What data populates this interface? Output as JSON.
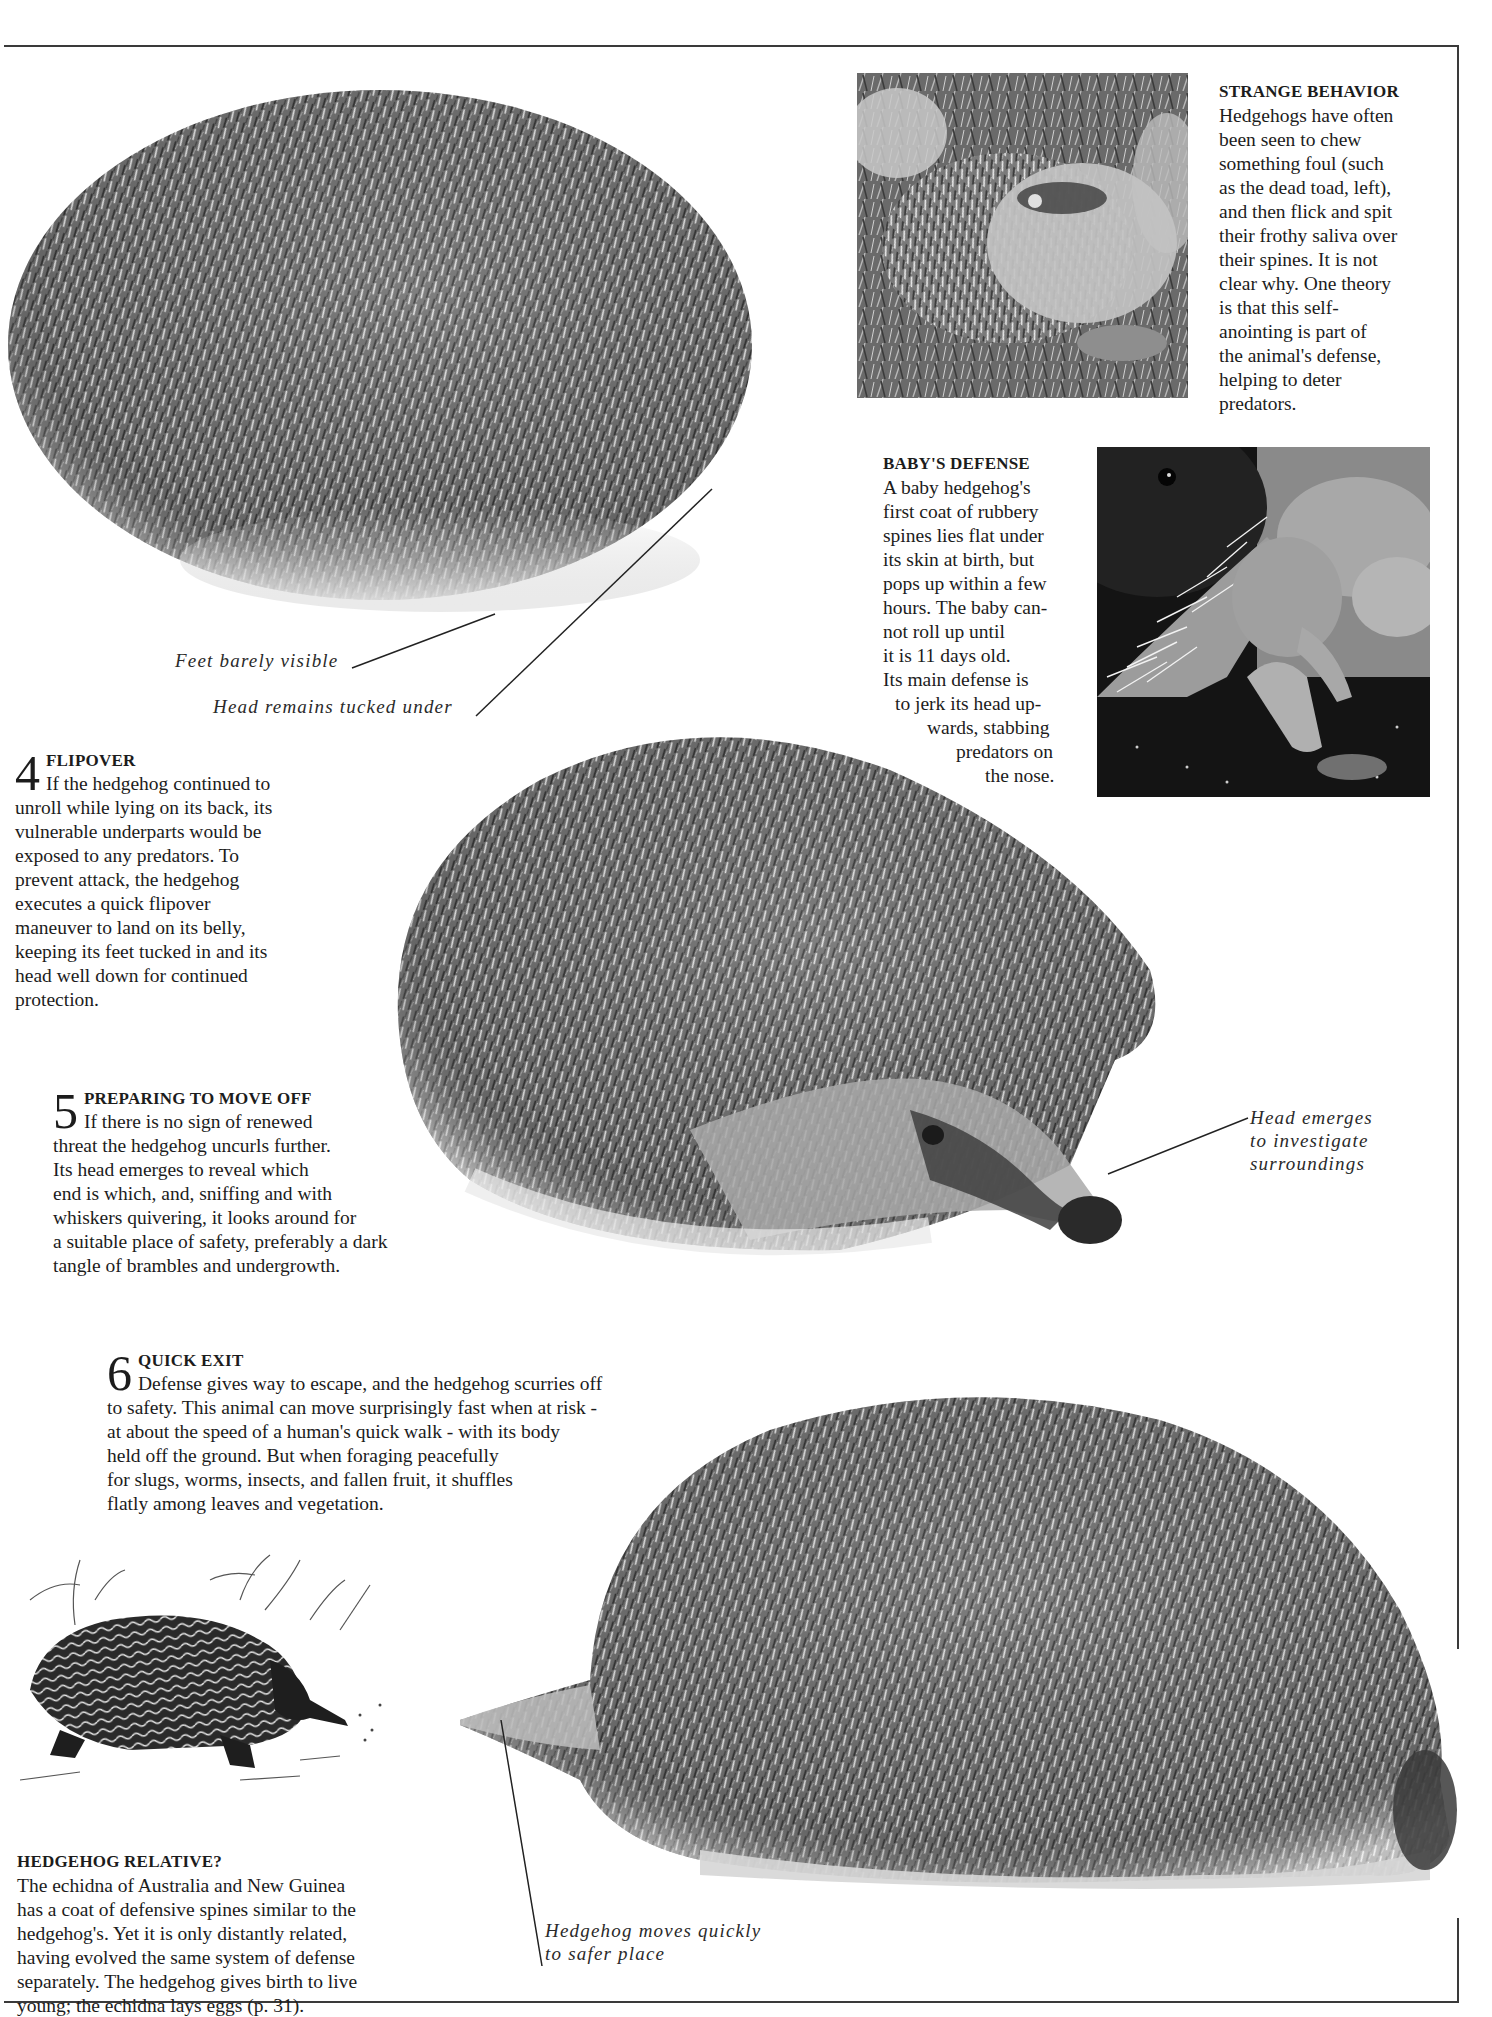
{
  "page": {
    "background": "#ffffff",
    "rule_color": "#3a3a3a",
    "text_color": "#1c1c1c"
  },
  "strange_behavior": {
    "heading": "STRANGE BEHAVIOR",
    "lines": [
      "Hedgehogs have often",
      "been seen to chew",
      "something foul (such",
      "as the dead toad, left),",
      "and then flick and spit",
      "their frothy saliva over",
      "their spines. It is not",
      "clear why. One theory",
      "is that this self-",
      "anointing is part of",
      "the animal's defense,",
      "helping to deter",
      "predators."
    ]
  },
  "babys_defense": {
    "heading": "BABY'S DEFENSE",
    "lines": [
      "A baby hedgehog's",
      "first coat of rubbery",
      "spines lies flat under",
      "its skin at birth, but",
      "pops up within a few",
      "hours. The baby can-",
      "not roll up until",
      "it is 11 days old.",
      "Its main defense is",
      "to jerk its head up-",
      "wards, stabbing",
      "predators on",
      "the nose."
    ]
  },
  "labels": {
    "feet": "Feet barely visible",
    "head_tucked": "Head remains tucked under",
    "head_emerges": [
      "Head emerges",
      "to investigate",
      "surroundings"
    ],
    "moves_quickly": [
      "Hedgehog moves quickly",
      "to safer place"
    ]
  },
  "steps": [
    {
      "number": "4",
      "heading": "FLIPOVER",
      "lines": [
        "If the hedgehog continued to",
        "unroll while lying on its back, its",
        "vulnerable underparts would be",
        "exposed to any predators. To",
        "prevent attack, the hedgehog",
        "executes a quick flipover",
        "maneuver to land on its belly,",
        "keeping its feet tucked in and its",
        "head well down for continued",
        "protection."
      ]
    },
    {
      "number": "5",
      "heading": "PREPARING TO MOVE OFF",
      "lines": [
        "If there is no sign of renewed",
        "threat the hedgehog uncurls further.",
        "Its head emerges to reveal which",
        "end is which, and, sniffing and with",
        "whiskers quivering, it looks around for",
        "a suitable place of safety, preferably a dark",
        "tangle of brambles and undergrowth."
      ]
    },
    {
      "number": "6",
      "heading": "QUICK EXIT",
      "lines": [
        "Defense gives way to escape, and the hedgehog scurries off",
        "to safety. This animal can move surprisingly fast when at risk -",
        "at about the speed of a human's quick walk - with its body",
        "held off the ground. But when foraging peacefully",
        "for slugs, worms, insects, and fallen fruit, it shuffles",
        "flatly among leaves and vegetation."
      ]
    }
  ],
  "hedgehog_relative": {
    "heading": "HEDGEHOG RELATIVE?",
    "lines": [
      "The echidna of Australia and New Guinea",
      "has a coat of defensive spines similar to the",
      "hedgehog's. Yet it is only distantly related,",
      "having evolved the same system of defense",
      "separately. The hedgehog gives birth to live",
      "young; the echidna lays eggs (p. 31)."
    ]
  },
  "images": {
    "rolled_hedgehog": "hedgehog rolled into ball",
    "self_anointing_photo": "hedgehog chewing dead toad",
    "baby_photo": "baby hedgehog with spines",
    "uncurling_hedgehog": "hedgehog uncurling, head emerging",
    "running_hedgehog": "hedgehog running away",
    "echidna_illustration": "engraving of an echidna"
  }
}
